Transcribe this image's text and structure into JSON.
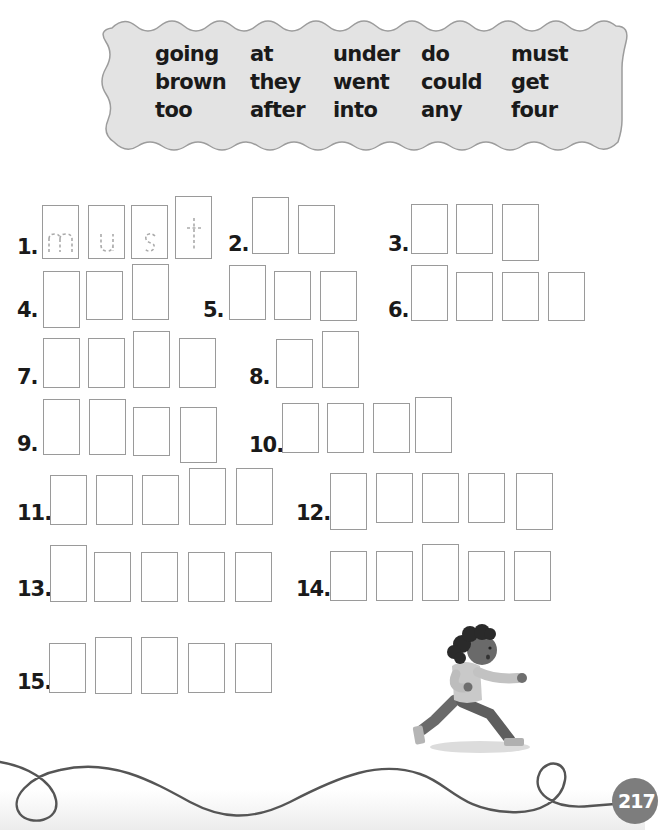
{
  "word_bank": {
    "columns": [
      [
        "going",
        "brown",
        "too"
      ],
      [
        "at",
        "they",
        "after"
      ],
      [
        "under",
        "went",
        "into"
      ],
      [
        "do",
        "could",
        "any"
      ],
      [
        "must",
        "get",
        "four"
      ]
    ]
  },
  "exercises": [
    {
      "number": "1.",
      "traced_letters": [
        "m",
        "u",
        "s",
        "t"
      ],
      "box_count": 4
    },
    {
      "number": "2.",
      "box_count": 2
    },
    {
      "number": "3.",
      "box_count": 3
    },
    {
      "number": "4.",
      "box_count": 3
    },
    {
      "number": "5.",
      "box_count": 3
    },
    {
      "number": "6.",
      "box_count": 4
    },
    {
      "number": "7.",
      "box_count": 4
    },
    {
      "number": "8.",
      "box_count": 2
    },
    {
      "number": "9.",
      "box_count": 4
    },
    {
      "number": "10.",
      "box_count": 4
    },
    {
      "number": "11.",
      "box_count": 5
    },
    {
      "number": "12.",
      "box_count": 5
    },
    {
      "number": "13.",
      "box_count": 5
    },
    {
      "number": "14.",
      "box_count": 5
    },
    {
      "number": "15.",
      "box_count": 5
    }
  ],
  "illustration": {
    "subject": "running-girl-icon"
  },
  "page_number": "217",
  "colors": {
    "banner_fill": "#e3e3e3",
    "banner_stroke": "#9c9c9c",
    "box_border": "#9a9a9a",
    "page_badge": "#7d7d7d"
  }
}
